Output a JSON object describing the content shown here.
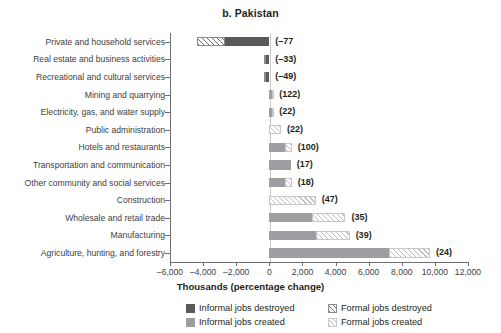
{
  "chart_data": {
    "type": "bar",
    "title": "b. Pakistan",
    "xlabel": "Thousands (percentage change)",
    "ylabel": "",
    "orientation": "horizontal",
    "stacked": true,
    "grid": false,
    "legend_position": "bottom",
    "xlim": [
      -6000,
      12000
    ],
    "xticks": [
      -6000,
      -4000,
      -2000,
      0,
      2000,
      4000,
      6000,
      8000,
      10000,
      12000
    ],
    "xticklabels": [
      "–6,000",
      "–4,000",
      "–2,000",
      "0",
      "2,000",
      "4,000",
      "6,000",
      "8,000",
      "10,000",
      "12,000"
    ],
    "series": [
      {
        "name": "Informal jobs destroyed",
        "key": "informal_destroyed",
        "color": "#595a5c",
        "pattern": "solid-dark"
      },
      {
        "name": "Formal jobs destroyed",
        "key": "formal_destroyed",
        "color": "#6d6e71",
        "pattern": "hatched-dark"
      },
      {
        "name": "Informal jobs created",
        "key": "informal_created",
        "color": "#9c9ea1",
        "pattern": "solid-light"
      },
      {
        "name": "Formal jobs created",
        "key": "formal_created",
        "color": "#bcbec0",
        "pattern": "hatched-light"
      }
    ],
    "categories": [
      "Private and household services",
      "Real estate and business activities",
      "Recreational and cultural services",
      "Mining and quarrying",
      "Electricity, gas, and water supply",
      "Public administration",
      "Hotels and restaurants",
      "Transportation and communication",
      "Other community and social services",
      "Construction",
      "Wholesale and retail trade",
      "Manufacturing",
      "Agriculture, hunting, and forestry"
    ],
    "rows": [
      {
        "category": "Private and household services",
        "informal_destroyed": -2700,
        "formal_destroyed": -1650,
        "informal_created": 0,
        "formal_created": 0,
        "label": "(–77"
      },
      {
        "category": "Real estate and business activities",
        "informal_destroyed": -230,
        "formal_destroyed": -120,
        "informal_created": 0,
        "formal_created": 0,
        "label": "(–33)"
      },
      {
        "category": "Recreational and cultural services",
        "informal_destroyed": -230,
        "formal_destroyed": -120,
        "informal_created": 0,
        "formal_created": 0,
        "label": "(–49)"
      },
      {
        "category": "Mining and quarrying",
        "informal_destroyed": 0,
        "formal_destroyed": 0,
        "informal_created": 180,
        "formal_created": 60,
        "label": "(122)"
      },
      {
        "category": "Electricity, gas, and water supply",
        "informal_destroyed": 0,
        "formal_destroyed": 0,
        "informal_created": 180,
        "formal_created": 60,
        "label": "(22)"
      },
      {
        "category": "Public administration",
        "informal_destroyed": 0,
        "formal_destroyed": 0,
        "informal_created": 0,
        "formal_created": 700,
        "label": "(22)"
      },
      {
        "category": "Hotels and restaurants",
        "informal_destroyed": 0,
        "formal_destroyed": 0,
        "informal_created": 930,
        "formal_created": 430,
        "label": "(100)"
      },
      {
        "category": "Transportation and communication",
        "informal_destroyed": 0,
        "formal_destroyed": 0,
        "informal_created": 1300,
        "formal_created": 0,
        "label": "(17)"
      },
      {
        "category": "Other community and social services",
        "informal_destroyed": 0,
        "formal_destroyed": 0,
        "informal_created": 930,
        "formal_created": 430,
        "label": "(18)"
      },
      {
        "category": "Construction",
        "informal_destroyed": 0,
        "formal_destroyed": 0,
        "informal_created": 0,
        "formal_created": 2800,
        "label": "(47)"
      },
      {
        "category": "Wholesale and retail trade",
        "informal_destroyed": 0,
        "formal_destroyed": 0,
        "informal_created": 2600,
        "formal_created": 2000,
        "label": "(35)"
      },
      {
        "category": "Manufacturing",
        "informal_destroyed": 0,
        "formal_destroyed": 0,
        "informal_created": 2800,
        "formal_created": 2050,
        "label": "(39)"
      },
      {
        "category": "Agriculture, hunting, and forestry",
        "informal_destroyed": 0,
        "formal_destroyed": 0,
        "informal_created": 7250,
        "formal_created": 2450,
        "label": "(24)"
      }
    ]
  },
  "legend": {
    "items": [
      {
        "label": "Informal jobs destroyed",
        "swatch": "informal-destroyed-swatch"
      },
      {
        "label": "Formal jobs destroyed",
        "swatch": "formal-destroyed-swatch"
      },
      {
        "label": "Informal jobs created",
        "swatch": "informal-created-swatch"
      },
      {
        "label": "Formal jobs created",
        "swatch": "formal-created-swatch"
      }
    ]
  }
}
